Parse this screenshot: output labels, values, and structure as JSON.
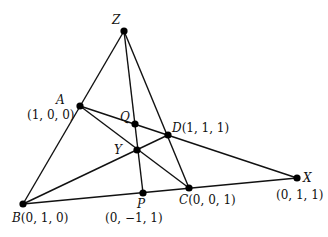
{
  "diagram": {
    "colors": {
      "line": "#111111",
      "point": "#000000",
      "background": "#ffffff"
    },
    "points": {
      "Z": {
        "x": 124,
        "y": 31
      },
      "A": {
        "x": 80,
        "y": 106
      },
      "Q": {
        "x": 135,
        "y": 124
      },
      "D": {
        "x": 168,
        "y": 135
      },
      "Y": {
        "x": 137,
        "y": 150
      },
      "B": {
        "x": 23,
        "y": 204
      },
      "P": {
        "x": 143,
        "y": 193
      },
      "C": {
        "x": 189,
        "y": 188
      },
      "X": {
        "x": 297,
        "y": 178
      }
    },
    "lines": [
      [
        "Z",
        "B"
      ],
      [
        "Z",
        "C"
      ],
      [
        "Z",
        "P"
      ],
      [
        "A",
        "X"
      ],
      [
        "A",
        "C"
      ],
      [
        "B",
        "D"
      ],
      [
        "B",
        "X"
      ]
    ],
    "labels": {
      "Z": {
        "name": "Z"
      },
      "A": {
        "name": "A",
        "coords": "(1, 0, 0)"
      },
      "Q": {
        "name": "Q"
      },
      "D": {
        "name": "D",
        "coords": "(1, 1, 1)"
      },
      "Y": {
        "name": "Y"
      },
      "B": {
        "name": "B",
        "coords": "(0, 1, 0)"
      },
      "P": {
        "name": "P",
        "coords": "(0, −1, 1)"
      },
      "C": {
        "name": "C",
        "coords": "(0, 0, 1)"
      },
      "X": {
        "name": "X",
        "coords": "(0, 1, 1)"
      }
    }
  }
}
